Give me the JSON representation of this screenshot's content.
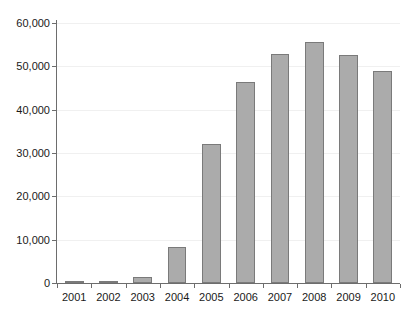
{
  "chart_data": {
    "type": "bar",
    "title": "",
    "subtitle": "",
    "xlabel": "",
    "ylabel": "",
    "categories": [
      "2001",
      "2002",
      "2003",
      "2004",
      "2005",
      "2006",
      "2007",
      "2008",
      "2009",
      "2010"
    ],
    "values": [
      200,
      500,
      1500,
      8300,
      32000,
      46500,
      52800,
      55600,
      52600,
      49000
    ],
    "ylim": [
      0,
      60000
    ],
    "yticks": [
      0,
      10000,
      20000,
      30000,
      40000,
      50000,
      60000
    ],
    "ytick_labels": [
      "0",
      "10,000",
      "20,000",
      "30,000",
      "40,000",
      "50,000",
      "60,000"
    ],
    "grid": true,
    "legend": false,
    "legend_position": "none",
    "series": [
      {
        "name": "",
        "values": [
          200,
          500,
          1500,
          8300,
          32000,
          46500,
          52800,
          55600,
          52600,
          49000
        ]
      }
    ]
  },
  "style": {
    "bar_fill": "#ababab",
    "bar_border": "#7a7a7a",
    "axis_color": "#6d6d6d",
    "gridline_color": "#f0f0f0",
    "text_color": "#1a1a1a",
    "background": "#ffffff"
  }
}
